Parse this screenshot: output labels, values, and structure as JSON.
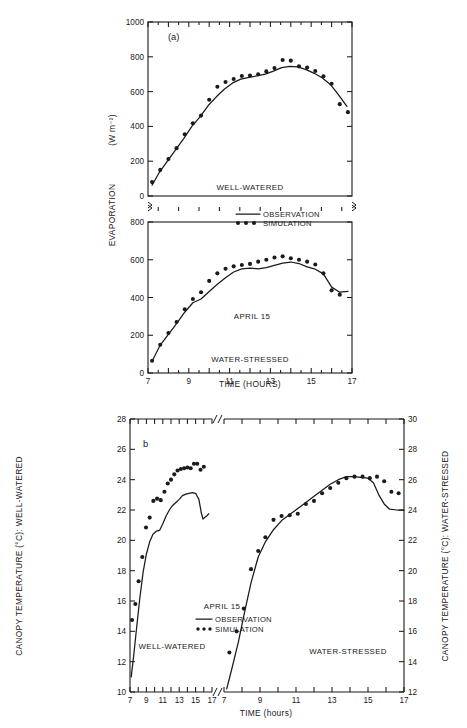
{
  "figure": {
    "background": "#ffffff",
    "ink": "#1a1a1a"
  },
  "chart_data": [
    {
      "type": "line",
      "id": "panel-a-well-watered",
      "panel_label": "(a)",
      "title": "",
      "xlabel": "TIME (HOURS)",
      "ylabel": "EVAPORATION",
      "ylabel_units": "(W m⁻²)",
      "xlim": [
        7,
        17
      ],
      "ylim": [
        0,
        1000
      ],
      "xticks": [
        7,
        8,
        9,
        10,
        11,
        12,
        13,
        14,
        15,
        16,
        17
      ],
      "xticklabels": [
        "7",
        "",
        "9",
        "",
        "11",
        "",
        "13",
        "",
        "15",
        "",
        "17"
      ],
      "yticks": [
        0,
        200,
        400,
        600,
        800,
        1000
      ],
      "yticklabels": [
        "0",
        "200",
        "400",
        "600",
        "800",
        "1000"
      ],
      "grid": false,
      "annotation": "WELL-WATERED",
      "broken_axis": true,
      "series": [
        {
          "name": "OBSERVATION",
          "style": "line",
          "x": [
            7.2,
            7.55,
            7.95,
            8.35,
            8.75,
            9.15,
            9.55,
            9.95,
            10.35,
            10.75,
            11.15,
            11.55,
            11.95,
            12.35,
            12.75,
            13.15,
            13.55,
            13.95,
            14.35,
            14.75,
            15.15,
            15.55,
            15.95,
            16.35,
            16.75
          ],
          "values": [
            62,
            135,
            200,
            265,
            330,
            400,
            455,
            520,
            570,
            615,
            650,
            672,
            682,
            690,
            700,
            718,
            738,
            745,
            742,
            726,
            705,
            678,
            640,
            580,
            515
          ]
        },
        {
          "name": "SIMULATION",
          "style": "dots",
          "x": [
            7.2,
            7.6,
            8.0,
            8.4,
            8.8,
            9.2,
            9.6,
            10.0,
            10.4,
            10.8,
            11.2,
            11.6,
            12.0,
            12.4,
            12.8,
            13.2,
            13.6,
            14.0,
            14.4,
            14.8,
            15.2,
            15.6,
            16.0,
            16.4,
            16.8
          ],
          "values": [
            80,
            150,
            212,
            275,
            355,
            418,
            462,
            553,
            628,
            655,
            672,
            690,
            692,
            700,
            716,
            735,
            782,
            778,
            745,
            738,
            718,
            688,
            645,
            528,
            482
          ]
        }
      ]
    },
    {
      "type": "line",
      "id": "panel-a-water-stressed",
      "panel_label": "",
      "xlabel": "TIME (HOURS)",
      "ylabel": "EVAPORATION",
      "ylabel_units": "(W m⁻²)",
      "xlim": [
        7,
        17
      ],
      "ylim": [
        0,
        800
      ],
      "xticks": [
        7,
        8,
        9,
        10,
        11,
        12,
        13,
        14,
        15,
        16,
        17
      ],
      "xticklabels": [
        "7",
        "",
        "9",
        "",
        "11",
        "",
        "13",
        "",
        "15",
        "",
        "17"
      ],
      "yticks": [
        0,
        200,
        400,
        600,
        800
      ],
      "yticklabels": [
        "0",
        "200",
        "400",
        "600",
        "800"
      ],
      "grid": false,
      "annotation": "WATER-STRESSED",
      "date_annotation": "APRIL 15",
      "broken_axis": true,
      "series": [
        {
          "name": "OBSERVATION",
          "style": "line",
          "x": [
            7.2,
            7.6,
            8.0,
            8.4,
            8.8,
            9.2,
            9.6,
            10.0,
            10.4,
            10.8,
            11.2,
            11.6,
            12.0,
            12.4,
            12.8,
            13.2,
            13.6,
            14.0,
            14.4,
            14.8,
            15.2,
            15.6,
            16.0,
            16.4,
            16.8
          ],
          "values": [
            62,
            148,
            205,
            262,
            322,
            372,
            392,
            432,
            470,
            505,
            535,
            552,
            556,
            552,
            558,
            570,
            582,
            588,
            580,
            562,
            550,
            525,
            455,
            428,
            432
          ]
        },
        {
          "name": "SIMULATION",
          "style": "dots",
          "x": [
            7.2,
            7.6,
            8.0,
            8.4,
            8.8,
            9.2,
            9.6,
            10.0,
            10.4,
            10.8,
            11.2,
            11.6,
            12.0,
            12.4,
            12.8,
            13.2,
            13.6,
            14.0,
            14.4,
            14.8,
            15.2,
            15.6,
            16.0,
            16.4,
            16.8
          ],
          "values": [
            65,
            150,
            212,
            270,
            338,
            392,
            428,
            488,
            528,
            552,
            565,
            572,
            578,
            590,
            600,
            612,
            618,
            608,
            600,
            590,
            575,
            528,
            438,
            415
          ]
        }
      ]
    },
    {
      "type": "line",
      "id": "panel-b-well-watered",
      "panel_label": "b",
      "xlabel": "TIME (hours)",
      "ylabel": "CANOPY TEMPERATURE (°C): WELL-WATERED",
      "xlim": [
        7,
        17
      ],
      "ylim": [
        10,
        28
      ],
      "xticks": [
        7,
        8,
        9,
        10,
        11,
        12,
        13,
        14,
        15,
        16,
        17
      ],
      "xticklabels": [
        "7",
        "",
        "9",
        "",
        "11",
        "",
        "13",
        "",
        "15",
        "",
        "17"
      ],
      "yticks": [
        10,
        12,
        14,
        16,
        18,
        20,
        22,
        24,
        26,
        28
      ],
      "yticklabels": [
        "10",
        "12",
        "14",
        "16",
        "18",
        "20",
        "22",
        "24",
        "26",
        "28"
      ],
      "grid": false,
      "annotation": "WELL-WATERED",
      "broken_axis": true,
      "series": [
        {
          "name": "OBSERVATION",
          "style": "line",
          "x": [
            7.15,
            7.45,
            7.8,
            8.2,
            8.6,
            9.0,
            9.4,
            9.8,
            10.2,
            10.6,
            11.0,
            11.4,
            11.8,
            12.2,
            12.6,
            13.0,
            13.4,
            13.8,
            14.2,
            14.6,
            15.0,
            15.4,
            15.7,
            15.9,
            16.1,
            16.35,
            16.6
          ],
          "values": [
            11.0,
            12.4,
            14.2,
            16.2,
            17.9,
            19.1,
            19.9,
            20.4,
            20.6,
            20.65,
            21.1,
            21.6,
            22.0,
            22.3,
            22.5,
            22.7,
            22.95,
            23.05,
            23.1,
            23.15,
            23.1,
            22.7,
            21.8,
            21.4,
            21.5,
            21.6,
            21.75
          ]
        },
        {
          "name": "SIMULATION",
          "style": "dots",
          "x": [
            7.25,
            7.65,
            8.05,
            8.5,
            8.95,
            9.4,
            9.85,
            10.3,
            10.75,
            11.2,
            11.6,
            12.0,
            12.4,
            12.8,
            13.2,
            13.6,
            14.0,
            14.4,
            14.8,
            15.2,
            15.6,
            16.0,
            16.4
          ],
          "values": [
            14.75,
            15.8,
            17.3,
            18.9,
            20.85,
            21.5,
            22.6,
            22.75,
            22.65,
            23.2,
            23.75,
            24.0,
            24.35,
            24.6,
            24.7,
            24.75,
            24.8,
            24.75,
            25.05,
            25.05,
            24.65,
            24.85
          ]
        }
      ]
    },
    {
      "type": "line",
      "id": "panel-b-water-stressed",
      "panel_label": "",
      "xlabel": "TIME (hours)",
      "ylabel": "CANOPY TEMPERATURE (°C): WATER-STRESSED",
      "xlim": [
        7,
        17
      ],
      "ylim": [
        12,
        30
      ],
      "xticks": [
        7,
        8,
        9,
        10,
        11,
        12,
        13,
        14,
        15,
        16,
        17
      ],
      "xticklabels": [
        "7",
        "",
        "9",
        "",
        "11",
        "",
        "13",
        "",
        "15",
        "",
        "17"
      ],
      "yticks": [
        12,
        14,
        16,
        18,
        20,
        22,
        24,
        26,
        28,
        30
      ],
      "yticklabels": [
        "12",
        "14",
        "16",
        "18",
        "20",
        "22",
        "24",
        "26",
        "28",
        "30"
      ],
      "grid": false,
      "annotation": "WATER-STRESSED",
      "broken_axis": true,
      "series": [
        {
          "name": "OBSERVATION",
          "style": "line",
          "x": [
            7.15,
            7.45,
            7.8,
            8.15,
            8.5,
            8.9,
            9.3,
            9.75,
            10.2,
            10.65,
            11.1,
            11.55,
            12.0,
            12.45,
            12.9,
            13.35,
            13.8,
            14.2,
            14.6,
            15.0,
            15.3,
            15.6,
            15.9,
            16.2,
            16.6,
            17.0
          ],
          "values": [
            12.2,
            13.6,
            15.3,
            17.3,
            19.2,
            20.9,
            21.9,
            22.7,
            23.3,
            23.7,
            24.1,
            24.5,
            24.9,
            25.3,
            25.7,
            26.0,
            26.2,
            26.2,
            26.15,
            26.1,
            25.8,
            25.0,
            24.4,
            24.05,
            24.0,
            24.0
          ]
        },
        {
          "name": "SIMULATION",
          "style": "dots",
          "x": [
            7.3,
            7.7,
            8.1,
            8.5,
            8.9,
            9.3,
            9.75,
            10.2,
            10.65,
            11.1,
            11.55,
            12.0,
            12.45,
            12.9,
            13.35,
            13.8,
            14.25,
            14.7,
            15.1,
            15.5,
            15.9,
            16.3,
            16.7
          ],
          "values": [
            14.6,
            16.0,
            17.5,
            20.1,
            21.3,
            22.2,
            23.35,
            23.6,
            23.65,
            23.75,
            24.4,
            24.6,
            25.1,
            25.45,
            25.8,
            26.1,
            26.2,
            26.2,
            26.1,
            26.2,
            25.9,
            25.2,
            25.1
          ]
        }
      ]
    }
  ],
  "panel_a": {
    "label": "(a)",
    "ylabel": "EVAPORATION",
    "yunits": "(W m⁻²)",
    "xlabel": "TIME (HOURS)",
    "anno_top": "WELL-WATERED",
    "anno_bottom": "WATER-STRESSED",
    "anno_date": "APRIL 15",
    "legend": {
      "observation": "OBSERVATION",
      "simulation": "SIMULATION"
    },
    "ytop_labels": [
      "1000",
      "800",
      "600",
      "400",
      "200",
      "0"
    ],
    "ybot_labels": [
      "800",
      "600",
      "400",
      "200",
      "0"
    ],
    "xlabels": [
      "7",
      "9",
      "11",
      "13",
      "15",
      "17"
    ]
  },
  "panel_b": {
    "label": "b",
    "ylabel_left": "CANOPY TEMPERATURE (°C): WELL-WATERED",
    "ylabel_right": "CANOPY TEMPERATURE (°C): WATER-STRESSED",
    "xlabel": "TIME (hours)",
    "anno_left": "WELL-WATERED",
    "anno_right": "WATER-STRESSED",
    "anno_date": "APRIL 15",
    "legend": {
      "observation": "OBSERVATION",
      "simulation": "SIMULATION"
    },
    "yleft_labels": [
      "28",
      "26",
      "24",
      "22",
      "20",
      "18",
      "16",
      "14",
      "12",
      "10"
    ],
    "yright_labels": [
      "30",
      "28",
      "26",
      "24",
      "22",
      "20",
      "18",
      "16",
      "14",
      "12"
    ],
    "xlabels_left": [
      "7",
      "9",
      "11",
      "13",
      "15",
      "17"
    ],
    "xlabels_right": [
      "7",
      "9",
      "11",
      "13",
      "15",
      "17"
    ]
  }
}
